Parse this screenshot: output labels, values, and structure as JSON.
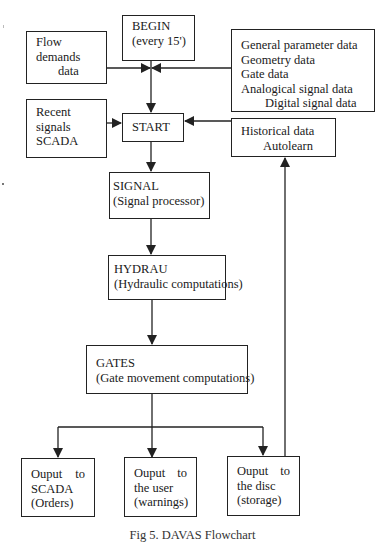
{
  "diagram": {
    "type": "flowchart",
    "nodes": {
      "begin": {
        "lines": [
          "BEGIN",
          "(every 15')"
        ]
      },
      "flow_demands": {
        "lines": [
          "Flow",
          "demands",
          "data"
        ]
      },
      "general_params": {
        "lines": [
          "General parameter data",
          "Geometry data",
          "Gate data",
          "Analogical signal data",
          "Digital signal data"
        ]
      },
      "recent_signals": {
        "lines": [
          "Recent",
          "signals",
          "SCADA"
        ]
      },
      "start": {
        "lines": [
          "START"
        ]
      },
      "historical": {
        "lines": [
          "Historical data",
          "Autolearn"
        ]
      },
      "signal": {
        "lines": [
          "SIGNAL",
          "(Signal processor)"
        ]
      },
      "hydrau": {
        "lines": [
          "HYDRAU",
          "(Hydraulic computations)"
        ]
      },
      "gates": {
        "lines": [
          "GATES",
          "(Gate movement computations)"
        ]
      },
      "out_scada": {
        "line1": [
          "Ouput",
          "to"
        ],
        "lines": [
          "SCADA",
          "(Orders)"
        ]
      },
      "out_user": {
        "line1": [
          "Ouput",
          "to"
        ],
        "lines": [
          "the user",
          "(warnings)"
        ]
      },
      "out_disc": {
        "line1": [
          "Ouput",
          "to"
        ],
        "lines": [
          "the disc",
          "(storage)"
        ]
      }
    },
    "edges": [
      [
        "begin",
        "start"
      ],
      [
        "flow_demands",
        "start"
      ],
      [
        "general_params",
        "start"
      ],
      [
        "recent_signals",
        "start"
      ],
      [
        "historical",
        "start"
      ],
      [
        "start",
        "signal"
      ],
      [
        "signal",
        "hydrau"
      ],
      [
        "hydrau",
        "gates"
      ],
      [
        "gates",
        "out_scada"
      ],
      [
        "gates",
        "out_user"
      ],
      [
        "gates",
        "out_disc"
      ],
      [
        "out_disc",
        "historical"
      ]
    ],
    "caption": "Fig 5. DAVAS Flowchart"
  },
  "colors": {
    "line": "#222222",
    "background": "#ffffff"
  }
}
